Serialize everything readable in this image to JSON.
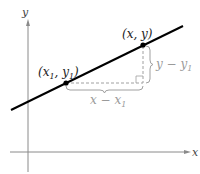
{
  "diagram": {
    "type": "point-slope line diagram",
    "axes": {
      "x_label": "x",
      "y_label": "y"
    },
    "points": [
      {
        "label_main": "(x",
        "label_sub": "1",
        "label_mid": ", y",
        "label_sub2": "1",
        "label_end": ")"
      },
      {
        "label": "(x, y)"
      }
    ],
    "run_label": {
      "main": "x − x",
      "sub": "1"
    },
    "rise_label": {
      "main": "y − y",
      "sub": "1"
    },
    "colors": {
      "line": "#000000",
      "axes": "#8a8a8a",
      "guides": "#a0a0a0",
      "text": "#222222",
      "guide_text": "#9a9a9a"
    }
  }
}
